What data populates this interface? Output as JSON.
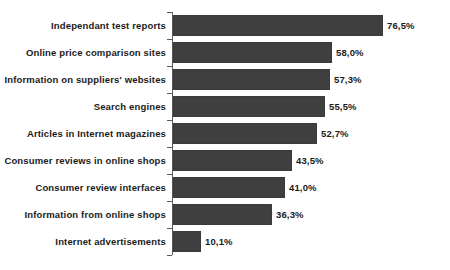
{
  "chart_data": {
    "type": "bar",
    "orientation": "horizontal",
    "title": "",
    "subtitle": "",
    "xlabel": "",
    "ylabel": "",
    "xlim": [
      0,
      80
    ],
    "grid": false,
    "legend": null,
    "value_suffix": "%",
    "decimal_separator": ",",
    "bar_color": "#3f3f3f",
    "axis_color": "#5a5a5a",
    "background_color": "#ffffff",
    "categories": [
      "Independant test reports",
      "Online price comparison sites",
      "Information on suppliers' websites",
      "Search engines",
      "Articles in Internet magazines",
      "Consumer reviews in online shops",
      "Consumer review interfaces",
      "Information from online shops",
      "Internet advertisements"
    ],
    "values": [
      76.5,
      58.0,
      57.3,
      55.5,
      52.7,
      43.5,
      41.0,
      36.3,
      10.1
    ],
    "data_labels": [
      "76,5%",
      "58,0%",
      "57,3%",
      "55,5%",
      "52,7%",
      "43,5%",
      "41,0%",
      "36,3%",
      "10,1%"
    ]
  }
}
